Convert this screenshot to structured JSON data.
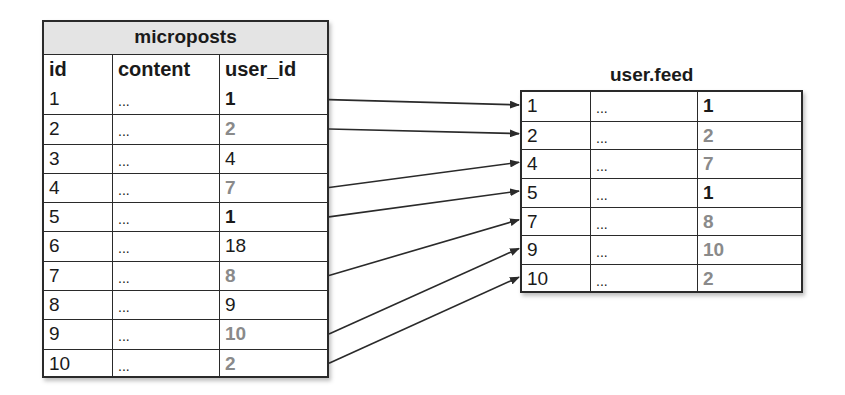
{
  "microposts": {
    "title": "microposts",
    "columns": [
      "id",
      "content",
      "user_id"
    ],
    "rows": [
      {
        "id": "1",
        "content": "...",
        "user_id": "1",
        "style": "bold"
      },
      {
        "id": "2",
        "content": "...",
        "user_id": "2",
        "style": "gray"
      },
      {
        "id": "3",
        "content": "...",
        "user_id": "4",
        "style": "normal"
      },
      {
        "id": "4",
        "content": "...",
        "user_id": "7",
        "style": "gray"
      },
      {
        "id": "5",
        "content": "...",
        "user_id": "1",
        "style": "bold"
      },
      {
        "id": "6",
        "content": "...",
        "user_id": "18",
        "style": "normal"
      },
      {
        "id": "7",
        "content": "...",
        "user_id": "8",
        "style": "gray"
      },
      {
        "id": "8",
        "content": "...",
        "user_id": "9",
        "style": "normal"
      },
      {
        "id": "9",
        "content": "...",
        "user_id": "10",
        "style": "gray"
      },
      {
        "id": "10",
        "content": "...",
        "user_id": "2",
        "style": "gray"
      }
    ]
  },
  "feed": {
    "title": "user.feed",
    "rows": [
      {
        "id": "1",
        "content": "...",
        "user_id": "1",
        "style": "bold"
      },
      {
        "id": "2",
        "content": "...",
        "user_id": "2",
        "style": "gray"
      },
      {
        "id": "4",
        "content": "...",
        "user_id": "7",
        "style": "gray"
      },
      {
        "id": "5",
        "content": "...",
        "user_id": "1",
        "style": "bold"
      },
      {
        "id": "7",
        "content": "...",
        "user_id": "8",
        "style": "gray"
      },
      {
        "id": "9",
        "content": "...",
        "user_id": "10",
        "style": "gray"
      },
      {
        "id": "10",
        "content": "...",
        "user_id": "2",
        "style": "gray"
      }
    ]
  },
  "arrows": [
    {
      "from_micropost_id": "1",
      "to_feed_row": 0
    },
    {
      "from_micropost_id": "2",
      "to_feed_row": 1
    },
    {
      "from_micropost_id": "4",
      "to_feed_row": 2
    },
    {
      "from_micropost_id": "5",
      "to_feed_row": 3
    },
    {
      "from_micropost_id": "7",
      "to_feed_row": 4
    },
    {
      "from_micropost_id": "9",
      "to_feed_row": 5
    },
    {
      "from_micropost_id": "10",
      "to_feed_row": 6
    }
  ],
  "colors": {
    "line": "#2a2a2a",
    "highlight_gray": "#8a8a8a",
    "title_bg": "#e4e4e4"
  }
}
